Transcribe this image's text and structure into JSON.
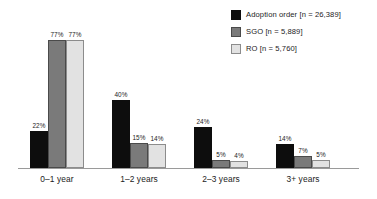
{
  "chart_data": {
    "type": "bar",
    "title": "",
    "subtitle": "",
    "xlabel": "",
    "ylabel": "",
    "ylim": [
      0,
      80
    ],
    "grid": false,
    "legend_position": "top-right",
    "value_label_suffix": "%",
    "categories": [
      "0–1 year",
      "1–2 years",
      "2–3 years",
      "3+ years"
    ],
    "series": [
      {
        "name": "Adoption order [n = 26,389]",
        "short_name": "Adoption order",
        "count_label": "n = 26,389",
        "color": "#0d0d0d",
        "border_color": "#0d0d0d",
        "values": [
          22,
          40,
          24,
          14
        ],
        "value_labels": [
          "22%",
          "40%",
          "24%",
          "14%"
        ]
      },
      {
        "name": "SGO [n = 5,889]",
        "short_name": "SGO",
        "count_label": "n = 5,889",
        "color": "#7a7a7a",
        "border_color": "#4a4a4a",
        "values": [
          77,
          15,
          5,
          7
        ],
        "value_labels": [
          "77%",
          "15%",
          "5%",
          "7%"
        ]
      },
      {
        "name": "RO [n = 5,760]",
        "short_name": "RO",
        "count_label": "n = 5,760",
        "color": "#e2e2e2",
        "border_color": "#8c8c8c",
        "values": [
          77,
          14,
          4,
          5
        ],
        "value_labels": [
          "77%",
          "14%",
          "4%",
          "5%"
        ]
      }
    ]
  },
  "legend": {
    "items": [
      {
        "label": "Adoption order [n = 26,389]",
        "swatch": "legend-swatch-adoption-order"
      },
      {
        "label": "SGO [n = 5,889]",
        "swatch": "legend-swatch-sgo"
      },
      {
        "label": "RO [n = 5,760]",
        "swatch": "legend-swatch-ro"
      }
    ]
  },
  "axis": {
    "category_labels": [
      "0–1 year",
      "1–2 years",
      "2–3 years",
      "3+ years"
    ]
  },
  "colors": {
    "series_1": "#0d0d0d",
    "series_2": "#7a7a7a",
    "series_3": "#e2e2e2",
    "axis": "#9a9a9a",
    "text": "#1c1c1c",
    "background": "#ffffff"
  }
}
